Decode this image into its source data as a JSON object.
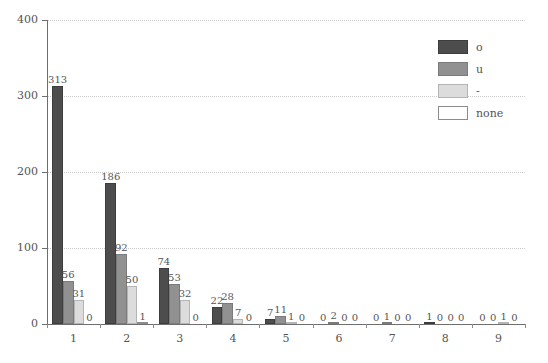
{
  "chart_data": {
    "type": "bar",
    "title": "",
    "subtitle": "",
    "xlabel": "",
    "ylabel": "",
    "categories": [
      "1",
      "2",
      "3",
      "4",
      "5",
      "6",
      "7",
      "8",
      "9"
    ],
    "series": [
      {
        "name": "o",
        "color": "#4d4d4d",
        "values": [
          313,
          186,
          74,
          22,
          7,
          0,
          0,
          1,
          0
        ]
      },
      {
        "name": "u",
        "color": "#919191",
        "values": [
          56,
          92,
          53,
          28,
          11,
          2,
          1,
          0,
          0
        ]
      },
      {
        "name": "-",
        "color": "#dcdcdc",
        "values": [
          31,
          50,
          32,
          7,
          1,
          0,
          0,
          0,
          1
        ]
      },
      {
        "name": "none",
        "color": "#ffffff",
        "values": [
          0,
          1,
          0,
          0,
          0,
          0,
          0,
          0,
          0
        ]
      }
    ],
    "ylim": [
      0,
      400
    ],
    "yticks": [
      0,
      100,
      200,
      300,
      400
    ],
    "ytick_labels": [
      "0",
      "100",
      "200",
      "300",
      "400"
    ],
    "xtick_labels": [
      "1",
      "2",
      "3",
      "4",
      "5",
      "6",
      "7",
      "8",
      "9"
    ],
    "grid": true,
    "grid_axis": "y",
    "grid_style": "dotted",
    "grid_color": "#c9c9c9",
    "legend_position": "top-right",
    "show_value_labels": true,
    "background": "#ffffff",
    "axis_color": "#6e6e6e",
    "text_color": "#555555"
  }
}
